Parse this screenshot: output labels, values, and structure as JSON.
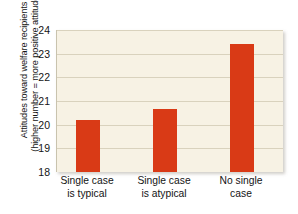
{
  "chart_data": {
    "type": "bar",
    "title": "",
    "subtitle": "",
    "xlabel": "",
    "ylabel": "Attitudes toward welfare recipients (higher number = more positive attitudes)",
    "ylabel_lines": [
      "Attitudes toward welfare recipients",
      "(higher number = more positive attitudes)"
    ],
    "categories": [
      "Single case is typical",
      "Single case is atypical",
      "No single case"
    ],
    "category_lines": [
      [
        "Single case",
        "is typical"
      ],
      [
        "Single case",
        "is atypical"
      ],
      [
        "No single",
        "case"
      ]
    ],
    "values": [
      20.2,
      20.65,
      23.4
    ],
    "ylim": [
      18,
      24
    ],
    "yticks": [
      18,
      19,
      20,
      21,
      22,
      23,
      24
    ],
    "ytick_labels": [
      "18",
      "19",
      "20",
      "21",
      "22",
      "23",
      "24"
    ],
    "grid": true,
    "grid_axis": "y",
    "legend": false,
    "legend_position": "none",
    "bar_color": "#d93a16",
    "plot_background": "#f7f2e4",
    "gridline_color": "#d9d2bd",
    "figure_background": "#ffffff"
  }
}
